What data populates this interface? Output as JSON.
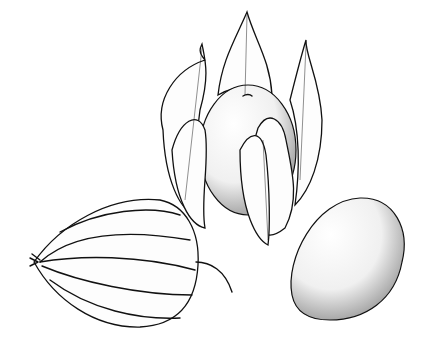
{
  "illustration": {
    "style": "pen-and-ink botanical illustration",
    "subject": "groundcherry (physalis)",
    "ink_color": "#111111",
    "background_color": "#ffffff",
    "elements": [
      {
        "name": "closed-husk",
        "description": "closed papery lantern husk with stem"
      },
      {
        "name": "opened-husk-with-fruit",
        "description": "husk opened showing berry inside"
      },
      {
        "name": "bare-berry",
        "description": "single smooth stippled berry"
      }
    ]
  }
}
